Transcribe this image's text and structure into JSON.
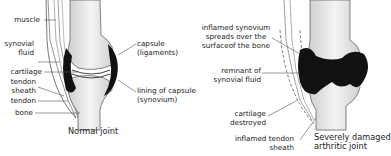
{
  "normal_joint": {
    "caption": "Normal joint",
    "labels": {
      "muscle": "muscle",
      "synovial_fluid_1": "synovial",
      "synovial_fluid_2": "fluid",
      "cartilage": "cartilage",
      "tendon_sheath_1": "tendon",
      "tendon_sheath_2": "sheath",
      "tendon": "tendon",
      "bone": "bone",
      "capsule_1": "capsule",
      "capsule_2": "(ligaments)",
      "lining_1": "lining of capsule",
      "lining_2": "(synovium)"
    }
  },
  "arthritic_joint": {
    "caption_1": "Severely damaged",
    "caption_2": "arthritic joint",
    "labels": {
      "inflamed_synovium_1": "inflamed synovium",
      "inflamed_synovium_2": "spreads over the",
      "inflamed_synovium_3": "surfaceof the bone",
      "remnant_1": "remnant of",
      "remnant_2": "synovial fluid",
      "cartilage_1": "cartilage",
      "cartilage_2": "destroyed",
      "tendon_sheath_1": "inflamed tendon",
      "tendon_sheath_2": "sheath"
    }
  },
  "colors": {
    "bone": "#e6e6e6",
    "synovium": "#111111",
    "line": "#555555"
  }
}
